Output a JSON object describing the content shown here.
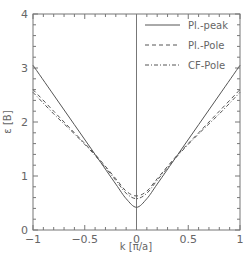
{
  "chart_data": {
    "type": "line",
    "title": "",
    "xlabel": "k [π/a]",
    "ylabel": "ε [B]",
    "xlim": [
      -1,
      1
    ],
    "ylim": [
      0,
      4
    ],
    "x_ticks": [
      "-1",
      "-0.5",
      "0",
      "0.5",
      "1"
    ],
    "y_ticks": [
      "0",
      "1",
      "2",
      "3",
      "4"
    ],
    "grid": false,
    "legend_position": "upper right",
    "vertical_line_at_x": 0,
    "x": [
      -1.0,
      -0.8,
      -0.6,
      -0.4,
      -0.2,
      -0.1,
      0.0,
      0.1,
      0.2,
      0.4,
      0.6,
      0.8,
      1.0
    ],
    "series": [
      {
        "name": "Pl.-peak",
        "style": "solid",
        "values": [
          3.05,
          2.5,
          1.95,
          1.4,
          0.85,
          0.58,
          0.42,
          0.58,
          0.85,
          1.4,
          1.95,
          2.5,
          3.05
        ]
      },
      {
        "name": "Pl.-Pole",
        "style": "dashed",
        "values": [
          2.6,
          2.2,
          1.8,
          1.4,
          0.95,
          0.72,
          0.63,
          0.72,
          0.95,
          1.4,
          1.8,
          2.2,
          2.6
        ]
      },
      {
        "name": "CF-Pole",
        "style": "dash-dot",
        "values": [
          2.55,
          2.15,
          1.78,
          1.38,
          0.92,
          0.68,
          0.58,
          0.68,
          0.92,
          1.38,
          1.78,
          2.15,
          2.55
        ]
      }
    ]
  }
}
